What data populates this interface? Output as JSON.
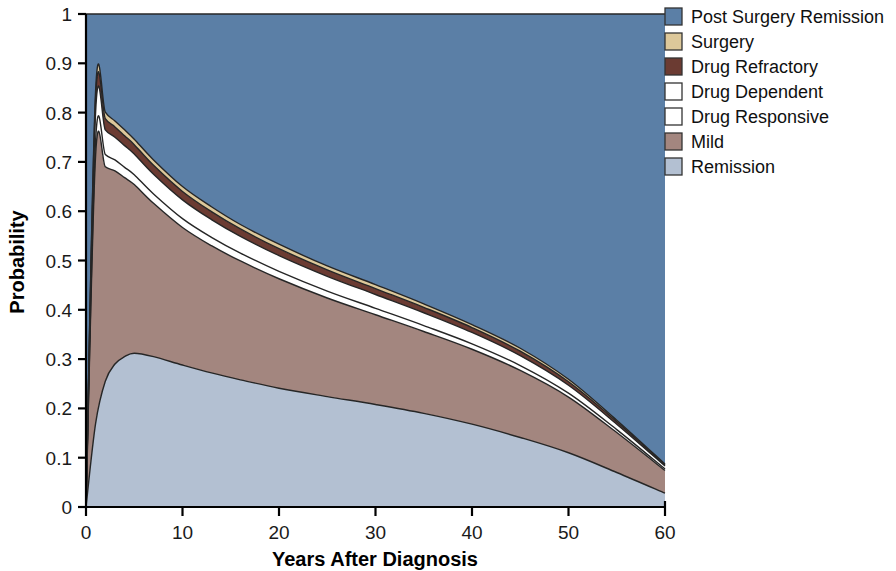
{
  "chart_data": {
    "type": "area",
    "title": "",
    "subtitle": "",
    "xlabel": "Years After Diagnosis",
    "ylabel": "Probability",
    "xlim": [
      0,
      60
    ],
    "ylim": [
      0,
      1
    ],
    "grid": false,
    "stacked": true,
    "legend_position": "top-right",
    "xticks": [
      0,
      10,
      20,
      30,
      40,
      50,
      60
    ],
    "xtick_labels": [
      "0",
      "10",
      "20",
      "30",
      "40",
      "50",
      "60"
    ],
    "yticks": [
      0,
      0.1,
      0.2,
      0.3,
      0.4,
      0.5,
      0.6,
      0.7,
      0.8,
      0.9,
      1
    ],
    "ytick_labels": [
      "0",
      "0.1",
      "0.2",
      "0.3",
      "0.4",
      "0.5",
      "0.6",
      "0.7",
      "0.8",
      "0.9",
      "1"
    ],
    "x": [
      0,
      1,
      2,
      3,
      4,
      5,
      7,
      10,
      13,
      16,
      20,
      25,
      30,
      35,
      40,
      45,
      50,
      55,
      60
    ],
    "series": [
      {
        "name": "Remission",
        "color": "#b3c0d2",
        "values": [
          0.0,
          0.17,
          0.255,
          0.29,
          0.305,
          0.312,
          0.305,
          0.288,
          0.272,
          0.258,
          0.241,
          0.224,
          0.208,
          0.19,
          0.168,
          0.141,
          0.11,
          0.07,
          0.028
        ]
      },
      {
        "name": "Mild",
        "color": "#a3867f",
        "values": [
          0.0,
          0.545,
          0.435,
          0.392,
          0.363,
          0.342,
          0.311,
          0.279,
          0.258,
          0.241,
          0.222,
          0.2,
          0.182,
          0.166,
          0.152,
          0.136,
          0.113,
          0.081,
          0.046
        ]
      },
      {
        "name": "Drug Responsive",
        "color": "#ffffff",
        "values": [
          0.0,
          0.03,
          0.025,
          0.022,
          0.021,
          0.02,
          0.019,
          0.018,
          0.017,
          0.016,
          0.015,
          0.014,
          0.013,
          0.012,
          0.011,
          0.01,
          0.008,
          0.006,
          0.003
        ]
      },
      {
        "name": "Drug Dependent",
        "color": "#ffffff",
        "values": [
          0.0,
          0.058,
          0.05,
          0.046,
          0.044,
          0.042,
          0.04,
          0.038,
          0.036,
          0.034,
          0.032,
          0.03,
          0.028,
          0.026,
          0.023,
          0.02,
          0.016,
          0.011,
          0.006
        ]
      },
      {
        "name": "Drug Refractory",
        "color": "#6b3b32",
        "values": [
          0.0,
          0.028,
          0.023,
          0.021,
          0.02,
          0.019,
          0.018,
          0.017,
          0.016,
          0.015,
          0.014,
          0.013,
          0.012,
          0.011,
          0.01,
          0.009,
          0.007,
          0.005,
          0.002
        ]
      },
      {
        "name": "Surgery",
        "color": "#ddc89a",
        "values": [
          0.0,
          0.015,
          0.013,
          0.012,
          0.012,
          0.011,
          0.011,
          0.01,
          0.01,
          0.009,
          0.009,
          0.008,
          0.008,
          0.007,
          0.006,
          0.006,
          0.005,
          0.003,
          0.002
        ]
      },
      {
        "name": "Post Surgery Remission",
        "color": "#5b7fa6",
        "values": [
          1.0,
          0.154,
          0.199,
          0.217,
          0.235,
          0.254,
          0.296,
          0.35,
          0.391,
          0.427,
          0.467,
          0.511,
          0.549,
          0.588,
          0.63,
          0.678,
          0.741,
          0.824,
          0.913
        ]
      }
    ]
  },
  "axes": {
    "ylabel": "Probability",
    "xlabel": "Years After Diagnosis"
  },
  "legend": {
    "items": [
      {
        "label": "Post Surgery Remission",
        "color": "#5b7fa6"
      },
      {
        "label": "Surgery",
        "color": "#ddc89a"
      },
      {
        "label": "Drug Refractory",
        "color": "#6b3b32"
      },
      {
        "label": "Drug Dependent",
        "color": "#ffffff"
      },
      {
        "label": "Drug Responsive",
        "color": "#ffffff"
      },
      {
        "label": "Mild",
        "color": "#a3867f"
      },
      {
        "label": "Remission",
        "color": "#b3c0d2"
      }
    ]
  }
}
